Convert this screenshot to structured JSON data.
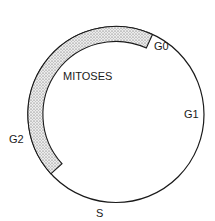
{
  "diagram": {
    "labels": {
      "g0": "G0",
      "g1": "G1",
      "s": "S",
      "g2": "G2",
      "mitoses": "MITOSES"
    },
    "colors": {
      "stroke": "#1a1a1a",
      "band_fill": "#d9d9d9",
      "background": "#ffffff"
    }
  }
}
